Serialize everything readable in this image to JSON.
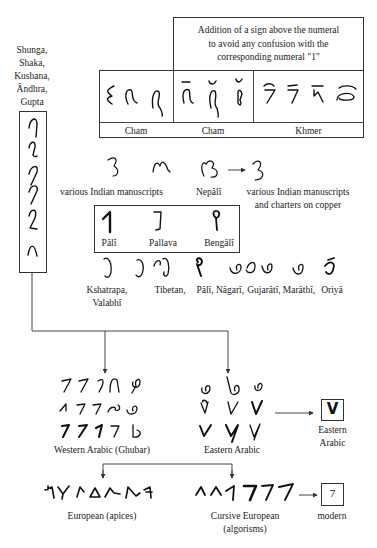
{
  "diagram": {
    "left_column": {
      "label_lines": [
        "Shunga,",
        "Shaka,",
        "Kushana,",
        "Ândhra,",
        "Gupta"
      ],
      "glyph_count": 6
    },
    "top_table": {
      "header": [
        "Addition of a sign above the numeral",
        "to avoid any confusion with the",
        "corresponding numeral \"1\""
      ],
      "columns": [
        {
          "label": "Cham",
          "glyph_count": 3,
          "marked": false
        },
        {
          "label": "Cham",
          "glyph_count": 3,
          "marked": true
        },
        {
          "label": "Khmer",
          "glyph_count": 4,
          "marked": true
        }
      ]
    },
    "middle_row": {
      "labels": {
        "various_indian": "various Indian manuscripts",
        "nepali": "Nepâlî",
        "various_copper_line1": "various Indian manuscripts",
        "various_copper_line2": "and charters on copper"
      }
    },
    "boxed_scripts": [
      {
        "label": "Pâlî"
      },
      {
        "label": "Pallava"
      },
      {
        "label": "Bengâlî"
      }
    ],
    "script_row": {
      "labels": {
        "kshatrapa_line1": "Kshatrapa,",
        "kshatrapa_line2": "Valabhî",
        "tibetan": "Tibetan,",
        "pali": "Pâlî,",
        "nagari": "Nâgarî,",
        "gujarati": "Gujarâtî,",
        "marathi": "Marâthî,",
        "oriya": "Oriyâ"
      }
    },
    "arabic": {
      "western_label": "Western Arabic (Ghubar)",
      "eastern_label": "Eastern Arabic",
      "eastern_box_glyph": "V",
      "eastern_box_label_line1": "Eastern",
      "eastern_box_label_line2": "Arabic"
    },
    "european": {
      "apices_label": "European (apices)",
      "cursive_label_line1": "Cursive European",
      "cursive_label_line2": "(algorisms)",
      "cursive_glyphs": [
        "٨",
        "٨",
        "1",
        "7",
        "7",
        "7"
      ],
      "modern_glyph": "7",
      "modern_label": "modern"
    },
    "colors": {
      "line": "#444444",
      "text": "#222222",
      "background": "#ffffff"
    }
  }
}
